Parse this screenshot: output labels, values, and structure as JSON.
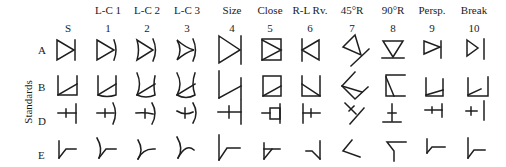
{
  "figure": {
    "side_label": "Standards",
    "columns": [
      {
        "key": "S",
        "header": "",
        "number": "S"
      },
      {
        "key": "1",
        "header": "L-C 1",
        "number": "1"
      },
      {
        "key": "2",
        "header": "L-C 2",
        "number": "2"
      },
      {
        "key": "3",
        "header": "L-C 3",
        "number": "3"
      },
      {
        "key": "4",
        "header": "Size",
        "number": "4"
      },
      {
        "key": "5",
        "header": "Close",
        "number": "5"
      },
      {
        "key": "6",
        "header": "R-L Rv.",
        "number": "6"
      },
      {
        "key": "7",
        "header": "45°R",
        "number": "7"
      },
      {
        "key": "8",
        "header": "90°R",
        "number": "8"
      },
      {
        "key": "9",
        "header": "Persp.",
        "number": "9"
      },
      {
        "key": "10",
        "header": "Break",
        "number": "10"
      }
    ],
    "rows": [
      {
        "label": "A",
        "description": "triangle pointing right with vertical bar"
      },
      {
        "label": "B",
        "description": "open box (U) with diagonal"
      },
      {
        "label": "D",
        "description": "horizontal stroke with small tick and vertical bar"
      },
      {
        "label": "E",
        "description": "vertical stroke with angled elbow"
      }
    ],
    "transformations": {
      "S": "standard",
      "1": "line curvature level 1",
      "2": "line curvature level 2",
      "3": "line curvature level 3",
      "4": "size change",
      "5": "closure",
      "6": "right-left reversal",
      "7": "45 degree rotation",
      "8": "90 degree rotation",
      "9": "perspective",
      "10": "break"
    },
    "stroke_color": "#1e1e1e",
    "background": "#ffffff"
  }
}
